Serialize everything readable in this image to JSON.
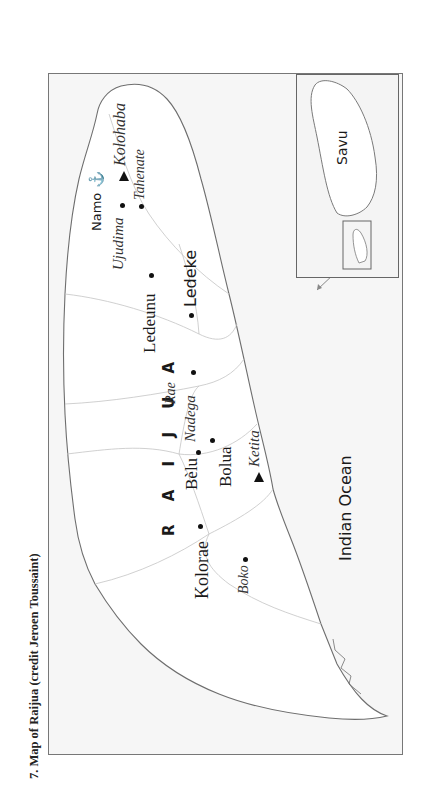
{
  "caption": "7. Map of Raijua (credit Jeroen Toussaint)",
  "map": {
    "island_name": "R A I J U A",
    "sea_label": "Indian Ocean",
    "colors": {
      "land": "#ffffff",
      "sea": "#f5f5f5",
      "coastline": "#6e6e6e",
      "boundaries": "#bdbdbd",
      "frame": "#777777",
      "text": "#111111"
    },
    "villages": [
      {
        "name": "Namo",
        "style": "sans"
      },
      {
        "name": "Ledeke",
        "style": "sans"
      },
      {
        "name": "Ledeunu",
        "style": "serif"
      },
      {
        "name": "Bèlu",
        "style": "serif"
      },
      {
        "name": "Bolua",
        "style": "serif"
      },
      {
        "name": "Kolorae",
        "style": "serif"
      }
    ],
    "places_italic": [
      {
        "name": "Kolohaba",
        "marker": "triangle"
      },
      {
        "name": "Tahenate",
        "marker": "dot"
      },
      {
        "name": "Ujudima",
        "marker": "dot"
      },
      {
        "name": "Rae",
        "marker": "none"
      },
      {
        "name": "Nadega",
        "marker": "dot"
      },
      {
        "name": "Ketita",
        "marker": "triangle"
      },
      {
        "name": "Boko",
        "marker": "dot"
      }
    ],
    "symbols": [
      {
        "name": "anchor",
        "glyph": "⚓",
        "near": "Namo"
      }
    ]
  },
  "inset": {
    "label": "Savu"
  }
}
